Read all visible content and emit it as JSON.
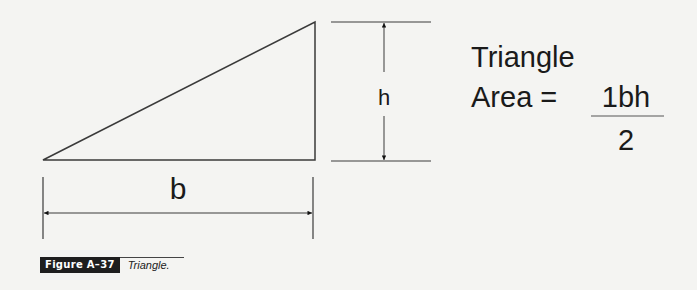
{
  "diagram": {
    "shape": "right-triangle",
    "labels": {
      "base": "b",
      "height": "h"
    },
    "formula": {
      "title": "Triangle",
      "lhs": "Area =",
      "numerator": "1bh",
      "denominator": "2"
    },
    "colors": {
      "line": "#3a3a3a",
      "background": "#f4f4f2",
      "caption_label_bg": "#1e1e1e"
    }
  },
  "caption": {
    "label": "Figure A–37",
    "title": "Triangle."
  }
}
